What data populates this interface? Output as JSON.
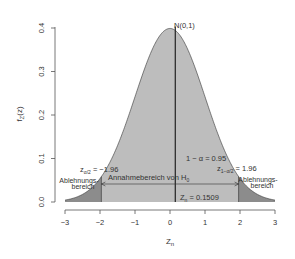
{
  "chart_data": {
    "type": "area",
    "title": "",
    "xlabel": "Z_n",
    "ylabel": "f_Z(z)",
    "xlim": [
      -3,
      3
    ],
    "ylim": [
      0,
      0.4
    ],
    "xticks": [
      "-3",
      "-2",
      "-1",
      "0",
      "1",
      "2",
      "3"
    ],
    "yticks": [
      "0.0",
      "0.1",
      "0.2",
      "0.3",
      "0.4"
    ],
    "grid": false,
    "legend": null,
    "series": [
      {
        "name": "N(0,1) density",
        "distribution": "standard normal",
        "mean": 0,
        "sd": 1
      }
    ],
    "regions": [
      {
        "name": "Ablehnungsbereich (left)",
        "from": -3,
        "to": -1.96,
        "color": "#8c8c8c"
      },
      {
        "name": "Annahmebereich von H0",
        "from": -1.96,
        "to": 1.96,
        "color": "#bdbdbd",
        "probability": 0.95
      },
      {
        "name": "Ablehnungsbereich (right)",
        "from": 1.96,
        "to": 3,
        "color": "#8c8c8c"
      }
    ],
    "critical_values": {
      "lower": -1.96,
      "upper": 1.96
    },
    "test_statistic": 0.1509,
    "annotations": [
      "N(0,1)",
      "z_{α/2} = -1.96",
      "z_{1-α/2} = 1.96",
      "1 - α = 0.95",
      "Annahmebereich von H₀",
      "Ablehnungs-bereich",
      "Z_n = 0.1509"
    ]
  },
  "labels": {
    "dist": "N(0,1)",
    "y_axis": "f",
    "y_axis_sub": "Z",
    "y_axis_tail": "(z)",
    "x_axis": "Z",
    "x_axis_sub": "n",
    "z_lower_main": "z",
    "z_lower_sub": "α/2",
    "z_lower_val": " = −1.96",
    "z_upper_main": "z",
    "z_upper_sub": "1−α/2",
    "z_upper_val": " = 1.96",
    "confidence": "1 − α = 0.95",
    "accept_main": "Annahmebereich von H",
    "accept_sub": "0",
    "reject_line1": "Ablehnungs-",
    "reject_line2": "bereich",
    "stat_main": "Z",
    "stat_sub": "n",
    "stat_val": " = 0.1509"
  },
  "colors": {
    "center_fill": "#bdbdbd",
    "tail_fill": "#8c8c8c",
    "line": "#333333",
    "axis": "#555555"
  }
}
